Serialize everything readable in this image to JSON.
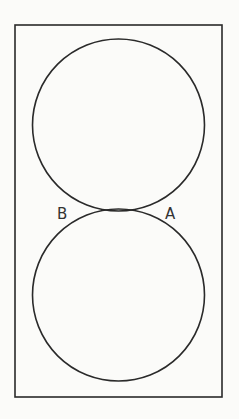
{
  "figure": {
    "labels": {
      "left_point": "B",
      "right_point": "A"
    },
    "colors": {
      "stroke": "#2a2a2a",
      "background": "#fbfbf9",
      "label": "#333333"
    }
  }
}
